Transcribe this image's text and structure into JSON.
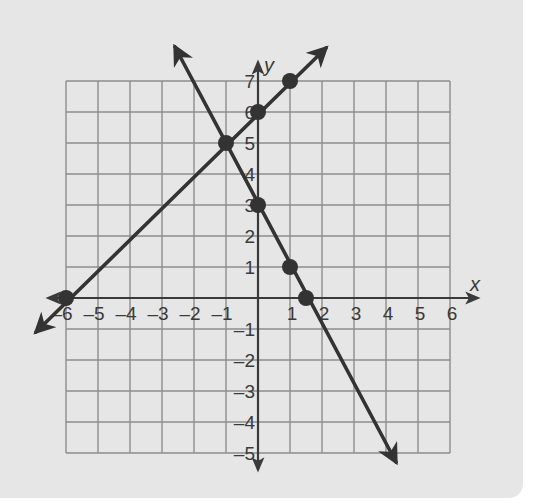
{
  "chart_data": {
    "type": "line",
    "title": "",
    "xlabel": "x",
    "ylabel": "y",
    "xlim": [
      -6,
      6
    ],
    "ylim": [
      -5,
      7
    ],
    "grid": true,
    "x_ticks": [
      "-6",
      "-5",
      "-4",
      "-3",
      "-2",
      "-1",
      "1",
      "2",
      "3",
      "4",
      "5",
      "6"
    ],
    "y_ticks": [
      "7",
      "6",
      "5",
      "4",
      "3",
      "2",
      "1",
      "-1",
      "-2",
      "-3",
      "-4",
      "-5"
    ],
    "series": [
      {
        "name": "y = x + 6",
        "slope": 1,
        "intercept": 6,
        "points": [
          [
            -6,
            0
          ],
          [
            -1,
            5
          ],
          [
            0,
            6
          ],
          [
            1,
            7
          ]
        ]
      },
      {
        "name": "y = -2x + 3",
        "slope": -2,
        "intercept": 3,
        "points": [
          [
            -1,
            5
          ],
          [
            0,
            3
          ],
          [
            1,
            1
          ],
          [
            1.5,
            0
          ]
        ]
      }
    ],
    "intersection": [
      -1,
      5
    ],
    "colors": {
      "background": "#e6e6e6",
      "grid": "#8c8c8c",
      "line": "#333333",
      "axis": "#3a3a3a"
    }
  }
}
